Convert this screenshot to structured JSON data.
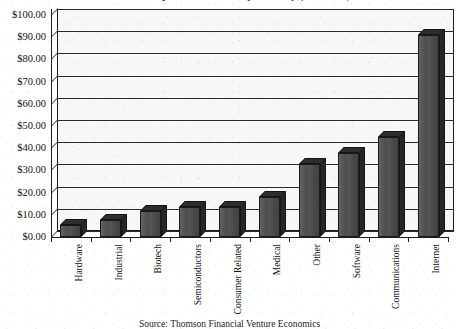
{
  "chart_data": {
    "type": "bar",
    "title": "Venture Capital Investment by Industry ($ Billions)",
    "subtitle": "",
    "xlabel": "",
    "ylabel": "",
    "categories": [
      "Hardware",
      "Industrial",
      "Biotech",
      "Semiconductors",
      "Consumer Related",
      "Medical",
      "Other",
      "Software",
      "Communications",
      "Internet"
    ],
    "values": [
      5.5,
      7.5,
      11.5,
      13.5,
      13.5,
      18.0,
      33.0,
      38.0,
      45.0,
      91.0
    ],
    "ylim": [
      0,
      100
    ],
    "ytick_step": 10,
    "ytick_labels": [
      "$0.00",
      "$10.00",
      "$20.00",
      "$30.00",
      "$40.00",
      "$50.00",
      "$60.00",
      "$70.00",
      "$80.00",
      "$90.00",
      "$100.00"
    ],
    "grid": true,
    "legend": false,
    "legend_position": "none",
    "style": "3d-column",
    "bar_color": "#4a4a4a",
    "bar_top_color": "#2e2e2e",
    "bar_side_color": "#262626",
    "axis_color": "#1d1d1d",
    "plot_background": "#f7f7f5",
    "page_background": "#ffffff"
  },
  "caption": {
    "source": "Source: Thomson Financial Venture Economics"
  }
}
